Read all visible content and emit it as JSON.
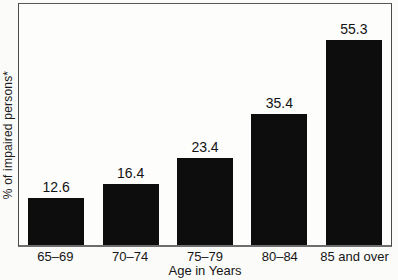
{
  "chart_data": {
    "type": "bar",
    "title": "",
    "categories": [
      "65–69",
      "70–74",
      "75–79",
      "80–84",
      "85 and over"
    ],
    "values": [
      12.6,
      16.4,
      23.4,
      35.4,
      55.3
    ],
    "value_labels": [
      "12.6",
      "16.4",
      "23.4",
      "35.4",
      "55.3"
    ],
    "xlabel": "Age in Years",
    "ylabel": "% of impaired persons*",
    "ylim": [
      0,
      65
    ],
    "grid": false,
    "legend": false,
    "y_ticks_shown": false,
    "bar_color": "#0d0d0d",
    "plot_background": "#fdfdfc",
    "frame_color": "#4a4a4a"
  }
}
